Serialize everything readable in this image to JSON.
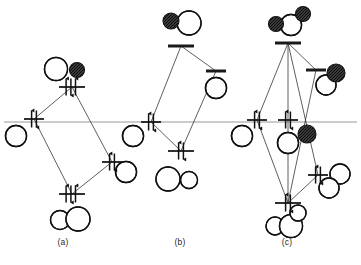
{
  "figure": {
    "type": "orbital-energy-level-diagram",
    "width": 361,
    "height": 265,
    "background_color": "#ffffff",
    "line_color": "#1a1a1a",
    "reference_line_color": "#8c8c8c",
    "reference_line_y": 122,
    "lobe_fill_white": "#ffffff",
    "lobe_fill_dark": "#3a3a3a",
    "lobe_stroke": "#111111"
  },
  "panels": [
    {
      "id": "a",
      "label": "(a)",
      "label_x": 63,
      "label_y": 243,
      "center_x": 72,
      "levels": [
        {
          "name": "antibonding-level",
          "kind": "occupied",
          "x": 72,
          "y": 87,
          "width": 26,
          "electrons": 2,
          "arrows": [
            "up-down",
            "up"
          ],
          "orbital": "sigma-star"
        },
        {
          "name": "left-fragment-level",
          "kind": "occupied",
          "x": 34,
          "y": 119,
          "width": 20,
          "electrons": 2,
          "arrows": [
            "up-down"
          ],
          "orbital": "left-lone-pair"
        },
        {
          "name": "right-fragment-level",
          "kind": "occupied",
          "x": 112,
          "y": 162,
          "width": 20,
          "electrons": 2,
          "arrows": [
            "up-down"
          ],
          "orbital": "right-lone-pair"
        },
        {
          "name": "bonding-level",
          "kind": "occupied",
          "x": 72,
          "y": 194,
          "width": 26,
          "electrons": 2,
          "arrows": [
            "up-down",
            "up"
          ],
          "orbital": "sigma-bonding"
        }
      ],
      "orbitals": [
        {
          "name": "top-orbital",
          "x": 66,
          "y": 69,
          "lobes": [
            {
              "cx": -10,
              "cy": 0,
              "r": 11.5,
              "fill": "white",
              "crescent": true
            },
            {
              "cx": 11,
              "cy": 1,
              "r": 7.5,
              "fill": "dark",
              "crescent": false
            }
          ]
        },
        {
          "name": "left-orbital",
          "x": 16,
          "y": 136,
          "lobes": [
            {
              "cx": 0,
              "cy": 0,
              "r": 10.5,
              "fill": "white",
              "crescent": true
            }
          ]
        },
        {
          "name": "right-orbital",
          "x": 126,
          "y": 172,
          "lobes": [
            {
              "cx": 0,
              "cy": 0,
              "r": 10.5,
              "fill": "white",
              "crescent": true
            }
          ]
        },
        {
          "name": "bottom-orbital",
          "x": 70,
          "y": 219,
          "lobes": [
            {
              "cx": -10,
              "cy": 1,
              "r": 9.5,
              "fill": "white",
              "crescent": true
            },
            {
              "cx": 8,
              "cy": 0,
              "r": 12.0,
              "fill": "white",
              "crescent": true
            }
          ]
        }
      ]
    },
    {
      "id": "b",
      "label": "(b)",
      "label_x": 180,
      "label_y": 243,
      "center_x": 181,
      "levels": [
        {
          "name": "antibonding-level",
          "kind": "empty",
          "x": 181,
          "y": 46,
          "width": 26,
          "electrons": 0,
          "arrows": [],
          "orbital": "sigma-star"
        },
        {
          "name": "right-fragment-level",
          "kind": "empty",
          "x": 216,
          "y": 71,
          "width": 20,
          "electrons": 0,
          "arrows": [],
          "orbital": "right-empty-orbital"
        },
        {
          "name": "left-fragment-level",
          "kind": "occupied",
          "x": 151,
          "y": 122,
          "width": 20,
          "electrons": 2,
          "arrows": [
            "up-down"
          ],
          "orbital": "left-lone-pair"
        },
        {
          "name": "bonding-level",
          "kind": "occupied",
          "x": 181,
          "y": 151,
          "width": 26,
          "electrons": 2,
          "arrows": [
            "up-down"
          ],
          "orbital": "sigma-bonding"
        }
      ],
      "orbitals": [
        {
          "name": "top-orbital",
          "x": 186,
          "y": 22,
          "lobes": [
            {
              "cx": -15,
              "cy": -1,
              "r": 8.0,
              "fill": "dark",
              "crescent": false
            },
            {
              "cx": 3,
              "cy": 1,
              "r": 12.0,
              "fill": "white",
              "crescent": true
            }
          ]
        },
        {
          "name": "right-orbital",
          "x": 216,
          "y": 88,
          "lobes": [
            {
              "cx": 0,
              "cy": 0,
              "r": 10.5,
              "fill": "white",
              "crescent": true
            }
          ]
        },
        {
          "name": "left-orbital",
          "x": 133,
          "y": 136,
          "lobes": [
            {
              "cx": 0,
              "cy": 0,
              "r": 10.5,
              "fill": "white",
              "crescent": true
            }
          ]
        },
        {
          "name": "bottom-orbital",
          "x": 178,
          "y": 178,
          "lobes": [
            {
              "cx": -10,
              "cy": 1,
              "r": 12.0,
              "fill": "white",
              "crescent": true
            },
            {
              "cx": 11,
              "cy": 2,
              "r": 8.5,
              "fill": "white",
              "crescent": true
            }
          ]
        }
      ]
    },
    {
      "id": "c",
      "label": "(c)",
      "label_x": 287,
      "label_y": 243,
      "center_x": 288,
      "levels": [
        {
          "name": "antibonding-level",
          "kind": "empty",
          "x": 288,
          "y": 43,
          "width": 26,
          "electrons": 0,
          "arrows": [],
          "orbital": "sigma-star"
        },
        {
          "name": "right-upper-fragment-level",
          "kind": "empty",
          "x": 316,
          "y": 70,
          "width": 20,
          "electrons": 0,
          "arrows": [],
          "orbital": "right-empty-orbital"
        },
        {
          "name": "left-fragment-level",
          "kind": "occupied",
          "x": 257,
          "y": 120,
          "width": 20,
          "electrons": 2,
          "arrows": [
            "up-down"
          ],
          "orbital": "left-lone-pair"
        },
        {
          "name": "center-fragment-level",
          "kind": "occupied",
          "x": 288,
          "y": 120,
          "width": 20,
          "electrons": 2,
          "arrows": [
            "up-down"
          ],
          "orbital": "center-lone-pair"
        },
        {
          "name": "right-lower-fragment-level",
          "kind": "occupied",
          "x": 318,
          "y": 175,
          "width": 20,
          "electrons": 2,
          "arrows": [
            "up-down"
          ],
          "orbital": "right-lone-pair"
        },
        {
          "name": "bonding-level",
          "kind": "occupied",
          "x": 288,
          "y": 203,
          "width": 26,
          "electrons": 2,
          "arrows": [
            "up-down"
          ],
          "orbital": "sigma-bonding"
        }
      ],
      "orbitals": [
        {
          "name": "top-orbital",
          "x": 290,
          "y": 21,
          "lobes": [
            {
              "cx": -14,
              "cy": 3,
              "r": 7.5,
              "fill": "dark",
              "crescent": false
            },
            {
              "cx": 1,
              "cy": 4,
              "r": 10.5,
              "fill": "white",
              "crescent": true
            },
            {
              "cx": 13,
              "cy": -7,
              "r": 7.5,
              "fill": "dark",
              "crescent": false
            }
          ]
        },
        {
          "name": "right-upper-orbital",
          "x": 330,
          "y": 80,
          "lobes": [
            {
              "cx": 6,
              "cy": -7,
              "r": 9.0,
              "fill": "dark",
              "crescent": false
            },
            {
              "cx": -4,
              "cy": 5,
              "r": 10.0,
              "fill": "white",
              "crescent": true
            }
          ]
        },
        {
          "name": "left-orbital",
          "x": 242,
          "y": 136,
          "lobes": [
            {
              "cx": 0,
              "cy": 0,
              "r": 10.5,
              "fill": "white",
              "crescent": true
            }
          ]
        },
        {
          "name": "center-orbital",
          "x": 291,
          "y": 140,
          "lobes": [
            {
              "cx": -3,
              "cy": 3,
              "r": 10.5,
              "fill": "white",
              "crescent": true
            },
            {
              "cx": 16,
              "cy": -6,
              "r": 9.0,
              "fill": "dark",
              "crescent": false
            }
          ]
        },
        {
          "name": "right-lower-orbital",
          "x": 334,
          "y": 182,
          "lobes": [
            {
              "cx": 6,
              "cy": -8,
              "r": 10.0,
              "fill": "white",
              "crescent": true
            },
            {
              "cx": -5,
              "cy": 6,
              "r": 10.0,
              "fill": "white",
              "crescent": true
            }
          ]
        },
        {
          "name": "bottom-orbital",
          "x": 288,
          "y": 222,
          "lobes": [
            {
              "cx": -13,
              "cy": 4,
              "r": 9.0,
              "fill": "white",
              "crescent": true
            },
            {
              "cx": 3,
              "cy": 4,
              "r": 11.5,
              "fill": "white",
              "crescent": true
            },
            {
              "cx": 10,
              "cy": -9,
              "r": 8.0,
              "fill": "white",
              "crescent": true
            }
          ]
        }
      ]
    }
  ]
}
